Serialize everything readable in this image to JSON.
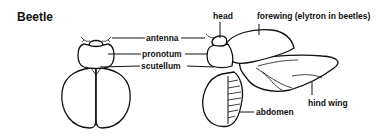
{
  "diagram": {
    "title": "Beetle",
    "labels": {
      "antenna": "antenna",
      "pronotum": "pronotum",
      "scutellum": "scutellum",
      "head": "head",
      "forewing": "forewing (elytron in beetles)",
      "hind_wing": "hind wing",
      "abdomen": "abdomen"
    },
    "colors": {
      "stroke": "#111111",
      "background": "#ffffff"
    }
  }
}
